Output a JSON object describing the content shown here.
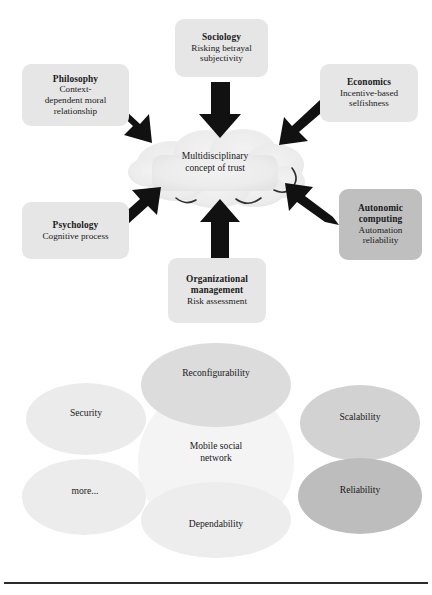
{
  "figure": {
    "top_diagram": {
      "center": {
        "line1": "Multidisciplinary",
        "line2": "concept of trust",
        "shape": "cloud",
        "fill": "#ececec"
      },
      "nodes": [
        {
          "id": "philosophy",
          "title": "Philosophy",
          "desc_line1": "Context-",
          "desc_line2": "dependent moral",
          "desc_line3": "relationship",
          "fill": "#e6e6e6",
          "arrow_direction": "down-right"
        },
        {
          "id": "sociology",
          "title": "Sociology",
          "desc_line1": "Risking betrayal",
          "desc_line2": "subjectivity",
          "desc_line3": "",
          "fill": "#e6e6e6",
          "arrow_direction": "down"
        },
        {
          "id": "economics",
          "title": "Economics",
          "desc_line1": "Incentive-based",
          "desc_line2": "selfishness",
          "desc_line3": "",
          "fill": "#e6e6e6",
          "arrow_direction": "down-left"
        },
        {
          "id": "autonomic",
          "title": "Autonomic",
          "title2": "computing",
          "desc_line1": "Automation",
          "desc_line2": "reliability",
          "desc_line3": "",
          "fill": "#bfbfbf",
          "arrow_direction": "up-left"
        },
        {
          "id": "psychology",
          "title": "Psychology",
          "desc_line1": "Cognitive process",
          "desc_line2": "",
          "desc_line3": "",
          "fill": "#e6e6e6",
          "arrow_direction": "up-right"
        },
        {
          "id": "organizational",
          "title": "Organizational",
          "title2": "management",
          "desc_line1": "Risk assessment",
          "desc_line2": "",
          "desc_line3": "",
          "fill": "#e6e6e6",
          "arrow_direction": "up"
        }
      ],
      "arrow_color": "#111111"
    },
    "bottom_diagram": {
      "center_label_line1": "Mobile social",
      "center_label_line2": "network",
      "ellipses": [
        {
          "id": "reconfigurability",
          "label": "Reconfigurability",
          "fill": "#dcdcdc"
        },
        {
          "id": "security",
          "label": "Security",
          "fill": "#ebebeb"
        },
        {
          "id": "scalability",
          "label": "Scalability",
          "fill": "#d2d2d2"
        },
        {
          "id": "more",
          "label": "more...",
          "fill": "#ececec"
        },
        {
          "id": "reliability",
          "label": "Reliability",
          "fill": "#bdbdbd"
        },
        {
          "id": "dependability",
          "label": "Dependability",
          "fill": "#ededed"
        },
        {
          "id": "center",
          "label": "Mobile social network",
          "fill": "#f3f3f3"
        }
      ]
    },
    "rule_color": "#2b2b2b"
  }
}
